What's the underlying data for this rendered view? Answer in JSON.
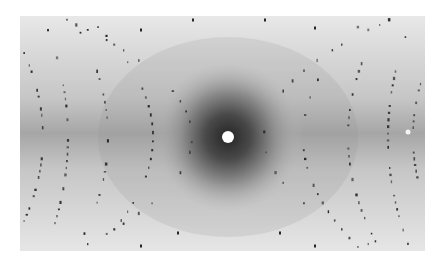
{
  "image": {
    "subject": "X-ray diffraction pattern photograph",
    "background_color": "#ffffff",
    "film": {
      "x": 20,
      "y": 16,
      "width": 405,
      "height": 235,
      "base_color": "#d8d8d8",
      "edge_color": "#ececec"
    },
    "center": {
      "x": 228,
      "y": 137,
      "hole_radius": 6,
      "hole_color": "#ffffff",
      "halo_color": "#1a1a1a"
    },
    "band_color": "#a8a8a8",
    "spot_color": "#2a2a2a",
    "layer_lines": [
      {
        "cx": 228,
        "rx": 36,
        "ry": 50
      },
      {
        "cx": 228,
        "rx": 75,
        "ry": 100
      },
      {
        "cx": 228,
        "rx": 120,
        "ry": 180
      },
      {
        "cx": 228,
        "rx": 160,
        "ry": 260
      },
      {
        "cx": 228,
        "rx": 185,
        "ry": 170
      }
    ],
    "extra_bright_spot": {
      "x": 408,
      "y": 132
    }
  }
}
